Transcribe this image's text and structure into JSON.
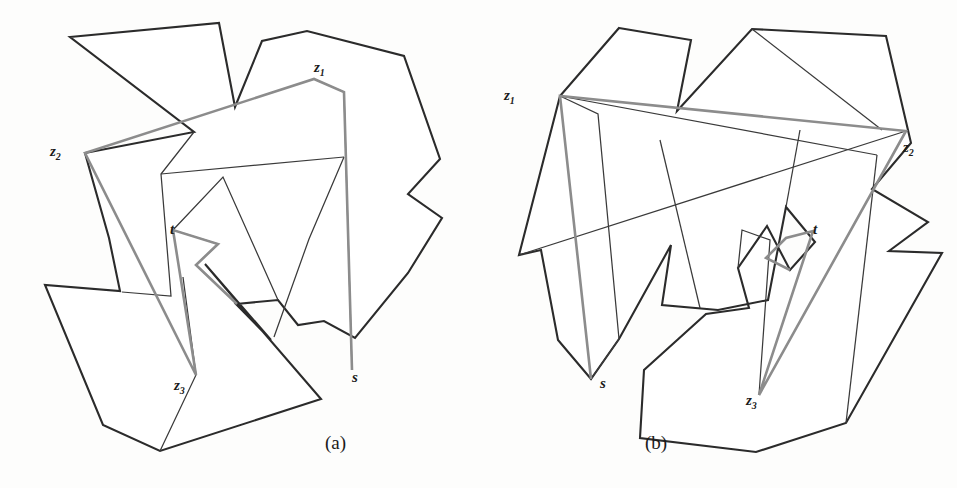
{
  "figure": {
    "kind": "geometry-diagram",
    "stroke_colors": {
      "polygon_outline": "#2b2b2b",
      "path_highlight": "#8c8c8c",
      "diagonal": "#3a3a3a",
      "background": "#fdfdfc"
    },
    "panels": [
      {
        "id": "a",
        "caption": "(a)",
        "caption_pos": {
          "x": 325,
          "y": 432
        },
        "labels": [
          {
            "name": "z1",
            "text": "z",
            "sub": "1",
            "x": 314,
            "y": 60
          },
          {
            "name": "z2",
            "text": "z",
            "sub": "2",
            "x": 50,
            "y": 144
          },
          {
            "name": "z3",
            "text": "z",
            "sub": "3",
            "x": 174,
            "y": 378
          },
          {
            "name": "t",
            "text": "t",
            "sub": "",
            "x": 170,
            "y": 222
          },
          {
            "name": "s",
            "text": "s",
            "sub": "",
            "x": 352,
            "y": 370
          }
        ],
        "polygon_outline": "M 70,37 L 219,23 L 235,107 L 262,41 L 307,31 L 404,56 L 440,159 L 408,194 L 442,218 L 408,273 L 355,338 L 324,321 L 298,325 L 278,300 L 236,304 L 271,340 L 205,264 L 245,311 L 321,399 L 160,451 L 103,425 L 45,285 L 120,291 L 109,238 L 85,153 L 194,132 Z",
        "subpaths": [
          "M 194,132 L 161,174 L 171,296 L 122,292",
          "M 160,451 L 196,375 L 183,277",
          "M 173,230 L 223,177 L 278,300",
          "M 173,230 L 218,244 L 196,265 L 237,304",
          "M 344,92 L 352,370",
          "M 344,157 L 161,174",
          "M 344,157 L 309,239 L 274,337",
          "M 314,79 L 344,92"
        ],
        "highlight_path": "M 352,370 L 344,92 L 314,79 L 85,153 L 196,375 L 173,230 L 218,244 L 196,265 L 237,304",
        "highlight_segments": [
          {
            "from": "s",
            "to": "z1"
          },
          {
            "from": "z1",
            "to": "z2"
          },
          {
            "from": "z2",
            "to": "z3"
          },
          {
            "from": "z3",
            "to": "t"
          }
        ]
      },
      {
        "id": "b",
        "caption": "(b)",
        "caption_pos": {
          "x": 645,
          "y": 432
        },
        "labels": [
          {
            "name": "z1",
            "text": "z",
            "sub": "1",
            "x": 504,
            "y": 88
          },
          {
            "name": "z2",
            "text": "z",
            "sub": "2",
            "x": 903,
            "y": 140
          },
          {
            "name": "z3",
            "text": "z",
            "sub": "3",
            "x": 746,
            "y": 393
          },
          {
            "name": "t",
            "text": "t",
            "sub": "",
            "x": 813,
            "y": 222
          },
          {
            "name": "s",
            "text": "s",
            "sub": "",
            "x": 600,
            "y": 376
          }
        ],
        "polygon_outline": "M 619,28 L 691,40 L 677,111 L 752,29 L 886,36 L 911,143 L 872,189 L 928,222 L 889,251 L 942,253 L 846,423 L 756,452 L 640,438 L 644,370 L 706,314 L 749,308 L 738,268 L 767,226 L 790,270 L 815,242 L 786,207 L 768,300 L 718,310 L 662,305 L 671,245 L 619,339 L 591,379 L 558,340 L 541,250 L 519,255 L 560,96 Z",
        "subpaths": [
          "M 560,96 L 598,114 L 619,339",
          "M 560,96 L 877,155",
          "M 752,29 L 882,130",
          "M 619,339 L 591,379",
          "M 660,140 L 700,308",
          "M 786,207 L 800,130",
          "M 877,155 L 846,423",
          "M 519,255 L 906,131",
          "M 738,268 L 742,230 L 770,240 L 759,395"
        ],
        "highlight_path": "M 591,379 L 560,96 L 906,131 L 759,395 L 813,231 L 786,238 L 766,258 L 790,270",
        "highlight_segments": [
          {
            "from": "s",
            "to": "z1"
          },
          {
            "from": "z1",
            "to": "z2"
          },
          {
            "from": "z2",
            "to": "z3"
          },
          {
            "from": "z3",
            "to": "t"
          }
        ]
      }
    ]
  }
}
